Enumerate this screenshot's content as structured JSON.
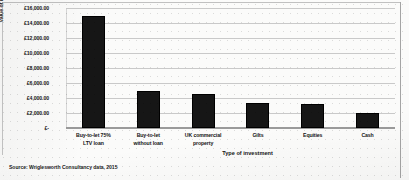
{
  "source_note": "Source: Wriglesworth Consultancy data, 2015",
  "chart_data": {
    "type": "bar",
    "title": "",
    "xlabel": "Type of investment",
    "ylabel": "Value of investment",
    "categories": [
      "Buy-to-let 75% LTV loan",
      "Buy-to-let without loan",
      "UK commercial property",
      "Gilts",
      "Equities",
      "Cash"
    ],
    "category_lines": [
      [
        "Buy-to-let 75%",
        "LTV loan"
      ],
      [
        "Buy-to-let",
        "without loan"
      ],
      [
        "UK commercial",
        "property"
      ],
      [
        "Gilts",
        ""
      ],
      [
        "Equities",
        ""
      ],
      [
        "Cash",
        ""
      ]
    ],
    "values": [
      15000,
      5000,
      4500,
      3400,
      3200,
      2000
    ],
    "ylim": [
      0,
      16000
    ],
    "ytick_values": [
      16000,
      14000,
      12000,
      10000,
      8000,
      6000,
      4000,
      2000,
      0
    ],
    "ytick_labels": [
      "£16,000.00",
      "£14,000.00",
      "£12,000.00",
      "£10,000.00",
      "£8,000.00",
      "£6,000.00",
      "£4,000.00",
      "£2,000.00",
      "£-"
    ],
    "grid": true,
    "legend": false,
    "bar_color": "#161616",
    "gridline_color": "#c9c9c9",
    "currency": "GBP"
  }
}
